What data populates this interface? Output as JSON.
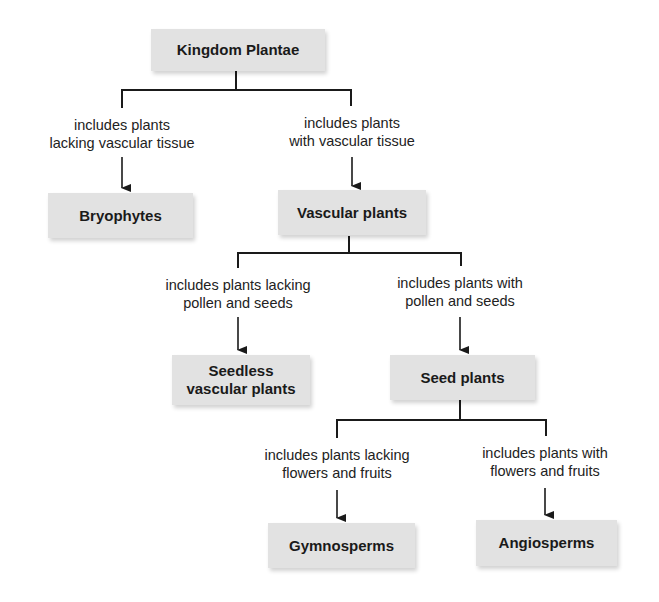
{
  "diagram": {
    "type": "classification-tree",
    "root": "Kingdom Plantae",
    "nodes": {
      "kingdom_plantae": "Kingdom Plantae",
      "bryophytes": "Bryophytes",
      "vascular_plants": "Vascular plants",
      "seedless_vascular_plants_line1": "Seedless",
      "seedless_vascular_plants_line2": "vascular plants",
      "seed_plants": "Seed plants",
      "gymnosperms": "Gymnosperms",
      "angiosperms": "Angiosperms"
    },
    "edges": {
      "to_bryophytes": {
        "line1": "includes plants",
        "line2": "lacking vascular tissue"
      },
      "to_vascular": {
        "line1": "includes plants",
        "line2": "with vascular tissue"
      },
      "to_seedless": {
        "line1": "includes plants lacking",
        "line2": "pollen and seeds"
      },
      "to_seed": {
        "line1": "includes plants with",
        "line2": "pollen and seeds"
      },
      "to_gymnosperms": {
        "line1": "includes plants lacking",
        "line2": "flowers and fruits"
      },
      "to_angiosperms": {
        "line1": "includes plants with",
        "line2": "flowers and fruits"
      }
    },
    "colors": {
      "box_fill": "#e2e2e2",
      "line": "#1a1a1a",
      "text": "#1a1a1a"
    }
  }
}
